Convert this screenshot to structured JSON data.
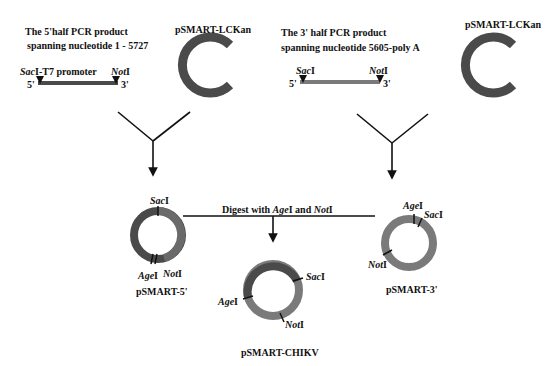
{
  "left_fragment": {
    "title_line1": "The 5'half PCR product",
    "title_line2": "spanning  nucleotide 1 - 5727",
    "site_left_italic": "Sac",
    "site_left_suffix": "I-T7 promoter",
    "site_right_italic": "Not",
    "site_right_suffix": "I",
    "end_5": "5'",
    "end_3": "3'",
    "vector_label": "pSMART-LCKan"
  },
  "right_fragment": {
    "title_line1": "The 3' half PCR product",
    "title_line2": "spanning  nucleotide 5605-poly A",
    "site_left_italic": "Sac",
    "site_left_suffix": "I",
    "site_right_italic": "Not",
    "site_right_suffix": "I",
    "end_5": "5'",
    "end_3": "3'",
    "vector_label": "pSMART-LCKan"
  },
  "plasmid_5": {
    "label": "pSMART-5'",
    "sites": [
      {
        "italic": "Sac",
        "suffix": "I"
      },
      {
        "italic": "Age",
        "suffix": "I"
      },
      {
        "italic": "Not",
        "suffix": "I"
      }
    ]
  },
  "plasmid_3": {
    "label": "pSMART-3'",
    "sites": [
      {
        "italic": "Age",
        "suffix": "I"
      },
      {
        "italic": "Sac",
        "suffix": "I"
      },
      {
        "italic": "Not",
        "suffix": "I"
      }
    ]
  },
  "digest": {
    "prefix": "Digest with ",
    "enzyme1_italic": "Age",
    "enzyme1_suffix": "I",
    "middle": " and ",
    "enzyme2_italic": "Not",
    "enzyme2_suffix": "I"
  },
  "final_plasmid": {
    "label": "pSMART-CHIKV",
    "sites": [
      {
        "italic": "Sac",
        "suffix": "I"
      },
      {
        "italic": "Age",
        "suffix": "I"
      },
      {
        "italic": "Not",
        "suffix": "I"
      }
    ]
  },
  "colors": {
    "dark_segment": "#4a4a4a",
    "light_segment": "#7a7a7a",
    "line": "#111111"
  }
}
